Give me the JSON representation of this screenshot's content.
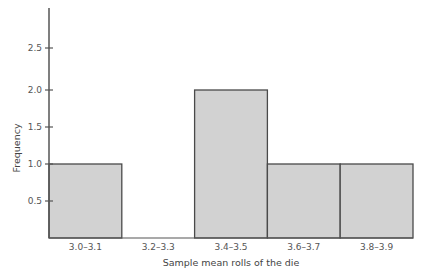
{
  "chart_data": {
    "type": "bar",
    "title": "",
    "xlabel": "Sample mean rolls of the die",
    "ylabel": "Frequency",
    "categories": [
      "3.0–3.1",
      "3.2–3.3",
      "3.4–3.5",
      "3.6–3.7",
      "3.8–3.9"
    ],
    "values": [
      1,
      0,
      2,
      1,
      1
    ],
    "ylim": [
      0,
      3.0
    ],
    "yticks": [
      0.5,
      1.0,
      1.5,
      2.0,
      2.5
    ],
    "ytick_labels": [
      "0.5",
      "1.0",
      "1.5",
      "2.0",
      "2.5"
    ],
    "grid": false,
    "legend": null,
    "bar_fill": "#d2d2d2",
    "bar_stroke": "#4a4a4a",
    "axis_color": "#555555"
  }
}
